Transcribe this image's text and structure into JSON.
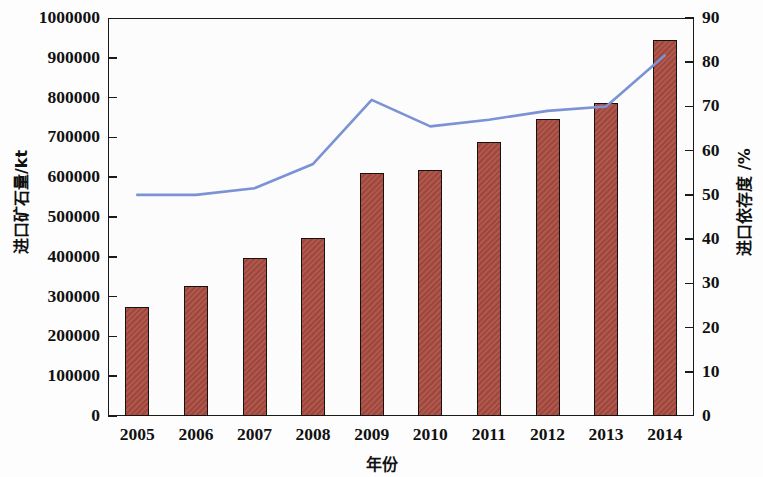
{
  "chart_data": {
    "type": "bar",
    "title": "",
    "subtitle": "",
    "xlabel": "年份",
    "categories": [
      "2005",
      "2006",
      "2007",
      "2008",
      "2009",
      "2010",
      "2011",
      "2012",
      "2013",
      "2014"
    ],
    "grid": false,
    "legend": "none",
    "axes": {
      "left": {
        "label": "进口矿石量/kt",
        "ylim": [
          0,
          1000000
        ],
        "tick_step": 100000,
        "ticks": [
          "0",
          "100000",
          "200000",
          "300000",
          "400000",
          "500000",
          "600000",
          "700000",
          "800000",
          "900000",
          "1000000"
        ],
        "tick_values": [
          0,
          100000,
          200000,
          300000,
          400000,
          500000,
          600000,
          700000,
          800000,
          900000,
          1000000
        ]
      },
      "right": {
        "label": "进口依存度 /%",
        "ylim": [
          0,
          90
        ],
        "tick_step": 10,
        "ticks": [
          "0",
          "10",
          "20",
          "30",
          "40",
          "50",
          "60",
          "70",
          "80",
          "90"
        ],
        "tick_values": [
          0,
          10,
          20,
          30,
          40,
          50,
          60,
          70,
          80,
          90
        ]
      }
    },
    "series": [
      {
        "name": "进口矿石量/kt",
        "type": "bar",
        "axis": "left",
        "color": "#a84b40",
        "edge_color": "#17120f",
        "values": [
          275000,
          327000,
          397000,
          448000,
          610000,
          617000,
          689000,
          745000,
          787000,
          945000
        ]
      },
      {
        "name": "进口依存度 /%",
        "type": "line",
        "axis": "right",
        "color": "#7b92d4",
        "values": [
          50.0,
          50.0,
          51.5,
          57.0,
          71.5,
          65.5,
          67.0,
          69.0,
          70.0,
          81.5
        ]
      }
    ]
  },
  "colors": {
    "bar_fill": "#a84b40",
    "bar_edge": "#17120f",
    "line": "#7b92d4",
    "axis": "#1a1a1a",
    "background": "#fdfdfd"
  }
}
